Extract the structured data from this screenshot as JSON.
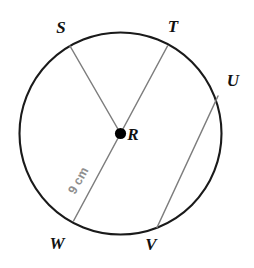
{
  "figure": {
    "background_color": "#ffffff",
    "circle": {
      "name": "circle-outline",
      "center_x": 120.5,
      "center_y": 133.5,
      "radius": 101,
      "stroke_color": "#1a1a1a",
      "stroke_width": 2.1,
      "fill": "none"
    },
    "center_point": {
      "name": "center-point-R",
      "x": 120.5,
      "y": 133.5,
      "dot_radius": 5.6,
      "color": "#000000"
    },
    "segments": [
      {
        "name": "radius-RS",
        "kind": "radius",
        "from": "S",
        "to": "R",
        "x1": 70.0,
        "y1": 46.0,
        "x2": 120.5,
        "y2": 133.5,
        "stroke_color": "#7d7d7d",
        "stroke_width": 1.5
      },
      {
        "name": "diameter-TW",
        "kind": "diameter",
        "from": "T",
        "to": "W",
        "x1": 167.5,
        "y1": 46.0,
        "x2": 73.5,
        "y2": 221.0,
        "stroke_color": "#7d7d7d",
        "stroke_width": 1.5
      },
      {
        "name": "chord-UV",
        "kind": "chord",
        "from": "U",
        "to": "V",
        "x1": 218.0,
        "y1": 96.0,
        "x2": 157.0,
        "y2": 227.5,
        "stroke_color": "#7d7d7d",
        "stroke_width": 1.5
      }
    ],
    "points": [
      {
        "name": "point-label-S",
        "label": "S",
        "label_x": 61,
        "label_y": 29,
        "vertex_x": 70.0,
        "vertex_y": 46.0,
        "color": "#111111"
      },
      {
        "name": "point-label-T",
        "label": "T",
        "label_x": 173,
        "label_y": 28,
        "vertex_x": 167.5,
        "vertex_y": 46.0,
        "color": "#111111"
      },
      {
        "name": "point-label-U",
        "label": "U",
        "label_x": 233,
        "label_y": 82,
        "vertex_x": 218.0,
        "vertex_y": 96.0,
        "color": "#111111"
      },
      {
        "name": "point-label-R",
        "label": "R",
        "label_x": 133,
        "label_y": 136,
        "vertex_x": 120.5,
        "vertex_y": 133.5,
        "color": "#111111"
      },
      {
        "name": "point-label-V",
        "label": "V",
        "label_x": 151,
        "label_y": 246,
        "vertex_x": 157.0,
        "vertex_y": 227.5,
        "color": "#111111"
      },
      {
        "name": "point-label-W",
        "label": "W",
        "label_x": 57,
        "label_y": 245,
        "vertex_x": 73.5,
        "vertex_y": 221.0,
        "color": "#111111"
      }
    ],
    "measurements": [
      {
        "name": "measure-label-9cm",
        "text": "9 cm",
        "value": 9,
        "unit": "cm",
        "applies_to": "radius-RW",
        "x": 79,
        "y": 181,
        "rotation_deg": -61.5,
        "color": "#8e8e8e"
      }
    ]
  }
}
